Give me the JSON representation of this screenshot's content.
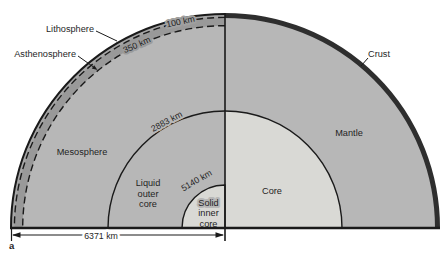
{
  "panel": {
    "label": "a"
  },
  "layers": {
    "lithosphere": "Lithosphere",
    "asthenosphere": "Asthenosphere",
    "mesosphere": "Mesosphere",
    "crust": "Crust",
    "mantle": "Mantle",
    "core": "Core",
    "liquid_outer_core": [
      "Liquid",
      "outer",
      "core"
    ],
    "solid_inner_core": [
      "Solid",
      "inner",
      "core"
    ]
  },
  "depths": {
    "lithosphere_base": "100 km",
    "asthenosphere_base": "350 km",
    "core_mantle_boundary": "2883 km",
    "inner_core_boundary": "5140 km",
    "earth_radius": "6371 km"
  },
  "colors": {
    "background": "#ffffff",
    "mantle_gray": "#b7b7b7",
    "lithosphere_band": "#a6a6a6",
    "asthenosphere_band": "#999999",
    "core_light": "#d9d9d5",
    "crust_dark": "#2e2e2e",
    "line": "#1a1a1a"
  }
}
